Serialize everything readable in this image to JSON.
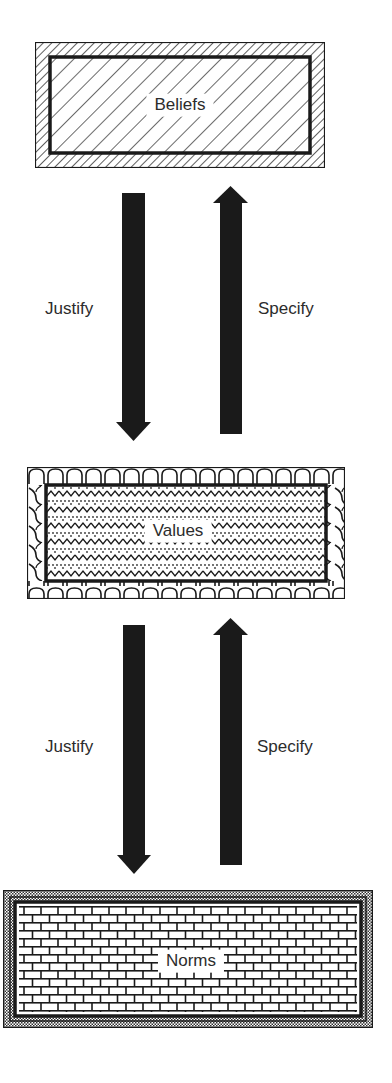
{
  "diagram": {
    "type": "hierarchy-flow",
    "colors": {
      "ink": "#1a1a1a",
      "text": "#2c2c2c",
      "background": "#ffffff"
    },
    "boxes": [
      {
        "id": "beliefs",
        "label": "Beliefs",
        "pattern": "diagonal-hatch"
      },
      {
        "id": "values",
        "label": "Values",
        "pattern": "zigzag-dotted-scalloped"
      },
      {
        "id": "norms",
        "label": "Norms",
        "pattern": "brick"
      }
    ],
    "connections": [
      {
        "between": [
          "beliefs",
          "values"
        ],
        "down_arrow": {
          "label": "Justify",
          "from": "beliefs",
          "to": "values"
        },
        "up_arrow": {
          "label": "Specify",
          "from": "values",
          "to": "beliefs"
        }
      },
      {
        "between": [
          "values",
          "norms"
        ],
        "down_arrow": {
          "label": "Justify",
          "from": "values",
          "to": "norms"
        },
        "up_arrow": {
          "label": "Specify",
          "from": "norms",
          "to": "values"
        }
      }
    ]
  }
}
